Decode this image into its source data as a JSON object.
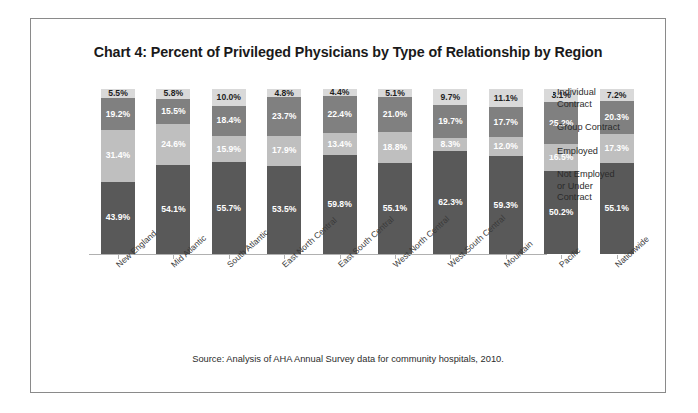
{
  "frame": {
    "title": "Chart 4: Percent of Privileged Physicians by Type of Relationship by Region",
    "source": "Source: Analysis of AHA Annual Survey data for community hospitals, 2010."
  },
  "legend": {
    "items": [
      {
        "label": "Individual Contract",
        "color": "#d9d9d9"
      },
      {
        "label": "Group Contract",
        "color": "#808080"
      },
      {
        "label": "Employed",
        "color": "#bfbfbf"
      },
      {
        "label": "Not Employed or Under Contract",
        "color": "#595959"
      }
    ]
  },
  "chart_data": {
    "type": "bar",
    "title": "Chart 4: Percent of Privileged Physicians by Type of Relationship by Region",
    "subtitle": "",
    "xlabel": "",
    "ylabel": "",
    "ylim": [
      0,
      100
    ],
    "grid": false,
    "stacked": true,
    "legend_position": "right",
    "categories": [
      "New England",
      "Mid Atlantic",
      "South Atlantic",
      "East North Central",
      "East South Central",
      "West North Central",
      "West South Central",
      "Mountain",
      "Pacific",
      "Nationwide"
    ],
    "series": [
      {
        "name": "Individual Contract",
        "color": "#d9d9d9",
        "values": [
          5.5,
          5.8,
          10.0,
          4.8,
          4.4,
          5.1,
          9.7,
          11.1,
          8.1,
          7.2
        ],
        "labels": [
          "5.5%",
          "5.8%",
          "10.0%",
          "4.8%",
          "4.4%",
          "5.1%",
          "9.7%",
          "11.1%",
          "8.1%",
          "7.2%"
        ]
      },
      {
        "name": "Group Contract",
        "color": "#808080",
        "values": [
          19.2,
          15.5,
          18.4,
          23.7,
          22.4,
          21.0,
          19.7,
          17.7,
          25.2,
          20.3
        ],
        "labels": [
          "19.2%",
          "15.5%",
          "18.4%",
          "23.7%",
          "22.4%",
          "21.0%",
          "19.7%",
          "17.7%",
          "25.2%",
          "20.3%"
        ]
      },
      {
        "name": "Employed",
        "color": "#bfbfbf",
        "values": [
          31.4,
          24.6,
          15.9,
          17.9,
          13.4,
          18.8,
          8.3,
          12.0,
          16.5,
          17.3
        ],
        "labels": [
          "31.4%",
          "24.6%",
          "15.9%",
          "17.9%",
          "13.4%",
          "18.8%",
          "8.3%",
          "12.0%",
          "16.5%",
          "17.3%"
        ]
      },
      {
        "name": "Not Employed or Under Contract",
        "color": "#595959",
        "values": [
          43.9,
          54.1,
          55.7,
          53.5,
          59.8,
          55.1,
          62.3,
          59.3,
          50.2,
          55.1
        ],
        "labels": [
          "43.9%",
          "54.1%",
          "55.7%",
          "53.5%",
          "59.8%",
          "55.1%",
          "62.3%",
          "59.3%",
          "50.2%",
          "55.1%"
        ]
      }
    ]
  }
}
